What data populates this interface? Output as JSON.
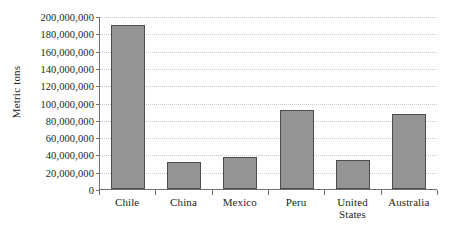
{
  "chart_data": {
    "type": "bar",
    "title": "",
    "xlabel": "",
    "ylabel": "Metric tons",
    "categories": [
      "Chile",
      "China",
      "Mexico",
      "Peru",
      "United States",
      "Australia"
    ],
    "category_lines": [
      [
        "Chile"
      ],
      [
        "China"
      ],
      [
        "Mexico"
      ],
      [
        "Peru"
      ],
      [
        "United",
        "States"
      ],
      [
        "Australia"
      ]
    ],
    "values": [
      190000000,
      31000000,
      37000000,
      91000000,
      34000000,
      87000000
    ],
    "ylim": [
      0,
      200000000
    ],
    "ytick_values": [
      0,
      20000000,
      40000000,
      60000000,
      80000000,
      100000000,
      120000000,
      140000000,
      160000000,
      180000000,
      200000000
    ],
    "ytick_labels": [
      "0",
      "20,000,000",
      "40,000,000",
      "60,000,000",
      "80,000,000",
      "100,000,000",
      "120,000,000",
      "140,000,000",
      "160,000,000",
      "180,000,000",
      "200,000,000"
    ],
    "grid": true,
    "legend": false,
    "legend_position": "none",
    "colors": {
      "bar_fill": "#949494",
      "bar_border": "#4d4d4d",
      "axis": "#6f6f6f",
      "gridline": "#c9c9c9",
      "text": "#231f20",
      "background": "#ffffff"
    }
  }
}
